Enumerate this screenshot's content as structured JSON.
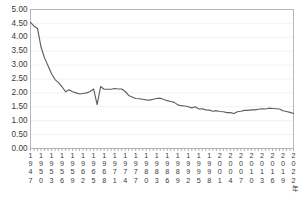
{
  "chart_data": {
    "type": "line",
    "title": "",
    "subtitle": "",
    "xlabel": "年",
    "ylabel": "",
    "xlim": [
      1947,
      2022
    ],
    "ylim": [
      0.0,
      5.0
    ],
    "grid": true,
    "legend": null,
    "legend_position": "none",
    "y_ticks": [
      "0.00",
      "0.50",
      "1.00",
      "1.50",
      "2.00",
      "2.50",
      "3.00",
      "3.50",
      "4.00",
      "4.50",
      "5.00"
    ],
    "y_tick_values": [
      0.0,
      0.5,
      1.0,
      1.5,
      2.0,
      2.5,
      3.0,
      3.5,
      4.0,
      4.5,
      5.0
    ],
    "x_tick_labels": [
      "1947",
      "1950",
      "1953",
      "1956",
      "1959",
      "1962",
      "1965",
      "1968",
      "1971",
      "1974",
      "1977",
      "1980",
      "1983",
      "1986",
      "1989",
      "1992",
      "1995",
      "1998",
      "2001",
      "2004",
      "2007",
      "2010",
      "2013",
      "2016",
      "2019",
      "2022"
    ],
    "x_tick_values": [
      1947,
      1950,
      1953,
      1956,
      1959,
      1962,
      1965,
      1968,
      1971,
      1974,
      1977,
      1980,
      1983,
      1986,
      1989,
      1992,
      1995,
      1998,
      2001,
      2004,
      2007,
      2010,
      2013,
      2016,
      2019,
      2022
    ],
    "x": [
      1947,
      1948,
      1949,
      1950,
      1951,
      1952,
      1953,
      1954,
      1955,
      1956,
      1957,
      1958,
      1959,
      1960,
      1961,
      1962,
      1963,
      1964,
      1965,
      1966,
      1967,
      1968,
      1969,
      1970,
      1971,
      1972,
      1973,
      1974,
      1975,
      1976,
      1977,
      1978,
      1979,
      1980,
      1981,
      1982,
      1983,
      1984,
      1985,
      1986,
      1987,
      1988,
      1989,
      1990,
      1991,
      1992,
      1993,
      1994,
      1995,
      1996,
      1997,
      1998,
      1999,
      2000,
      2001,
      2002,
      2003,
      2004,
      2005,
      2006,
      2007,
      2008,
      2009,
      2010,
      2011,
      2012,
      2013,
      2014,
      2015,
      2016,
      2017,
      2018,
      2019,
      2020,
      2021,
      2022
    ],
    "values": [
      4.54,
      4.4,
      4.32,
      3.65,
      3.26,
      2.98,
      2.69,
      2.48,
      2.37,
      2.22,
      2.04,
      2.11,
      2.04,
      2.0,
      1.96,
      1.98,
      2.0,
      2.05,
      2.14,
      1.58,
      2.23,
      2.13,
      2.13,
      2.13,
      2.16,
      2.14,
      2.14,
      2.05,
      1.91,
      1.85,
      1.8,
      1.79,
      1.77,
      1.75,
      1.74,
      1.77,
      1.8,
      1.81,
      1.76,
      1.72,
      1.69,
      1.66,
      1.57,
      1.54,
      1.53,
      1.5,
      1.46,
      1.5,
      1.42,
      1.43,
      1.39,
      1.38,
      1.34,
      1.36,
      1.33,
      1.32,
      1.29,
      1.29,
      1.26,
      1.32,
      1.34,
      1.37,
      1.37,
      1.39,
      1.39,
      1.41,
      1.43,
      1.42,
      1.45,
      1.44,
      1.43,
      1.42,
      1.36,
      1.33,
      1.3,
      1.26
    ],
    "series": [
      {
        "name": "合計特殊出生率",
        "color": "#5e5e5e",
        "values": [
          4.54,
          4.4,
          4.32,
          3.65,
          3.26,
          2.98,
          2.69,
          2.48,
          2.37,
          2.22,
          2.04,
          2.11,
          2.04,
          2.0,
          1.96,
          1.98,
          2.0,
          2.05,
          2.14,
          1.58,
          2.23,
          2.13,
          2.13,
          2.13,
          2.16,
          2.14,
          2.14,
          2.05,
          1.91,
          1.85,
          1.8,
          1.79,
          1.77,
          1.75,
          1.74,
          1.77,
          1.8,
          1.81,
          1.76,
          1.72,
          1.69,
          1.66,
          1.57,
          1.54,
          1.53,
          1.5,
          1.46,
          1.5,
          1.42,
          1.43,
          1.39,
          1.38,
          1.34,
          1.36,
          1.33,
          1.32,
          1.29,
          1.29,
          1.26,
          1.32,
          1.34,
          1.37,
          1.37,
          1.39,
          1.39,
          1.41,
          1.43,
          1.42,
          1.45,
          1.44,
          1.43,
          1.42,
          1.36,
          1.33,
          1.3,
          1.26
        ]
      }
    ],
    "annotations": []
  },
  "style": {
    "line_color": "#5e5e5e",
    "grid_color": "#e9e9e9",
    "frame_color": "#a6a6a6",
    "text_color": "#3a3a3a",
    "background": "#ffffff"
  }
}
